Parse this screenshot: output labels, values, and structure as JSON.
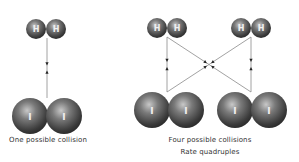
{
  "colors": {
    "background": "#ffffff",
    "sphere_highlight": "#bdbdbd",
    "sphere_mid": "#6e6e6e",
    "sphere_dark": "#2e2e2e",
    "line": "#8a8a8a",
    "arrow": "#222222",
    "label": "#f0f0f0",
    "caption": "#333333"
  },
  "left_panel": {
    "h2": {
      "atoms": [
        {
          "label": "H",
          "cx": 36,
          "cy": 29,
          "r": 10
        },
        {
          "label": "H",
          "cx": 56,
          "cy": 29,
          "r": 10
        }
      ]
    },
    "i2": {
      "atoms": [
        {
          "label": "I",
          "cx": 30,
          "cy": 116,
          "r": 18
        },
        {
          "label": "I",
          "cx": 64,
          "cy": 116,
          "r": 18
        }
      ]
    },
    "collision_lines": [
      {
        "x1": 47,
        "y1": 38,
        "x2": 47,
        "y2": 98
      }
    ],
    "caption": "One possible collision"
  },
  "right_panel": {
    "h2_molecules": [
      {
        "atoms": [
          {
            "label": "H",
            "cx": 157,
            "cy": 28,
            "r": 10
          },
          {
            "label": "H",
            "cx": 177,
            "cy": 28,
            "r": 10
          }
        ]
      },
      {
        "atoms": [
          {
            "label": "H",
            "cx": 241,
            "cy": 28,
            "r": 10
          },
          {
            "label": "H",
            "cx": 261,
            "cy": 28,
            "r": 10
          }
        ]
      }
    ],
    "i2_molecules": [
      {
        "atoms": [
          {
            "label": "I",
            "cx": 152,
            "cy": 110,
            "r": 18
          },
          {
            "label": "I",
            "cx": 186,
            "cy": 110,
            "r": 18
          }
        ]
      },
      {
        "atoms": [
          {
            "label": "I",
            "cx": 235,
            "cy": 110,
            "r": 18
          },
          {
            "label": "I",
            "cx": 269,
            "cy": 110,
            "r": 18
          }
        ]
      }
    ],
    "collision_lines": [
      {
        "x1": 167,
        "y1": 37,
        "x2": 167,
        "y2": 92
      },
      {
        "x1": 251,
        "y1": 37,
        "x2": 251,
        "y2": 92
      },
      {
        "x1": 167,
        "y1": 37,
        "x2": 251,
        "y2": 92
      },
      {
        "x1": 251,
        "y1": 37,
        "x2": 167,
        "y2": 92
      }
    ],
    "caption_line1": "Four possible collisions",
    "caption_line2": "Rate quadruples"
  }
}
